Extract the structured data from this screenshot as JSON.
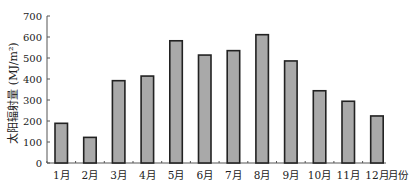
{
  "chart_data": {
    "type": "bar",
    "title": "",
    "xlabel": "月份",
    "ylabel": "太阳辐射量 (MJ/m²)",
    "categories": [
      "1月",
      "2月",
      "3月",
      "4月",
      "5月",
      "6月",
      "7月",
      "8月",
      "9月",
      "10月",
      "11月",
      "12月"
    ],
    "values": [
      189,
      122,
      392,
      414,
      582,
      514,
      535,
      611,
      486,
      344,
      294,
      224
    ],
    "ylim": [
      0,
      700
    ],
    "yticks": [
      0,
      100,
      200,
      300,
      400,
      500,
      600,
      700
    ],
    "grid": false,
    "legend": null,
    "colors": {
      "bar_fill": "#a9a9a9",
      "bar_stroke": "#222222",
      "axis": "#555555"
    }
  }
}
